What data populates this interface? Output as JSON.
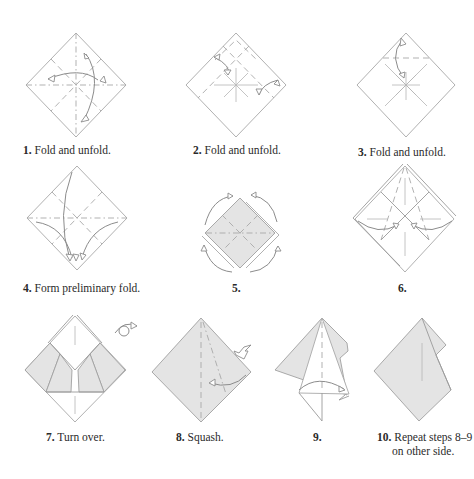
{
  "diagram": {
    "type": "origami-folding-instructions",
    "colors": {
      "paper": "#ffffff",
      "shaded_side": "#e4e4e4",
      "lines": "#a0a0a0",
      "text": "#2a2a2a"
    },
    "steps": [
      {
        "number": "1.",
        "text": "Fold and unfold."
      },
      {
        "number": "2.",
        "text": "Fold and unfold."
      },
      {
        "number": "3.",
        "text": "Fold and unfold."
      },
      {
        "number": "4.",
        "text": "Form preliminary fold."
      },
      {
        "number": "5.",
        "text": ""
      },
      {
        "number": "6.",
        "text": ""
      },
      {
        "number": "7.",
        "text": "Turn over."
      },
      {
        "number": "8.",
        "text": "Squash."
      },
      {
        "number": "9.",
        "text": ""
      },
      {
        "number": "10.",
        "text": "Repeat steps 8–9",
        "text2": "on other side."
      }
    ]
  }
}
